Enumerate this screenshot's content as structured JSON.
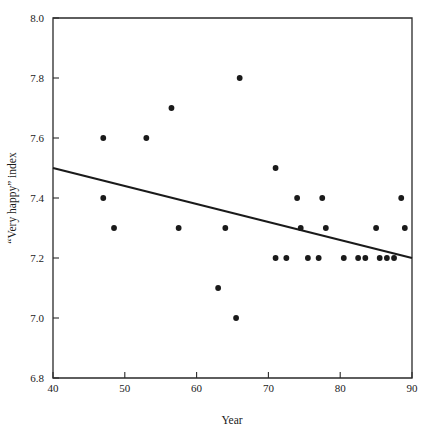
{
  "chart_data": {
    "type": "scatter",
    "title": "",
    "xlabel": "Year",
    "ylabel": "“Very happy” index",
    "xlim": [
      40,
      90
    ],
    "ylim": [
      6.8,
      8.0
    ],
    "xticks": [
      40,
      50,
      60,
      70,
      80,
      90
    ],
    "xtick_labels": [
      "40",
      "50",
      "60",
      "70",
      "80",
      "90"
    ],
    "yticks": [
      6.8,
      7.0,
      7.2,
      7.4,
      7.6,
      7.8,
      8.0
    ],
    "ytick_labels": [
      "6.8",
      "7.0",
      "7.2",
      "7.4",
      "7.6",
      "7.8",
      "8.0"
    ],
    "grid": false,
    "legend": null,
    "series": [
      {
        "name": "“Very happy” index by year",
        "marker": "filled-circle",
        "color": "#1a1a1a",
        "points": [
          {
            "x": 47,
            "y": 7.6
          },
          {
            "x": 47,
            "y": 7.4
          },
          {
            "x": 48.5,
            "y": 7.3
          },
          {
            "x": 53,
            "y": 7.6
          },
          {
            "x": 56.5,
            "y": 7.7
          },
          {
            "x": 57.5,
            "y": 7.3
          },
          {
            "x": 63,
            "y": 7.1
          },
          {
            "x": 64,
            "y": 7.3
          },
          {
            "x": 65.5,
            "y": 7.0
          },
          {
            "x": 66,
            "y": 7.8
          },
          {
            "x": 71,
            "y": 7.5
          },
          {
            "x": 71,
            "y": 7.2
          },
          {
            "x": 72.5,
            "y": 7.2
          },
          {
            "x": 74,
            "y": 7.4
          },
          {
            "x": 74.5,
            "y": 7.3
          },
          {
            "x": 75.5,
            "y": 7.2
          },
          {
            "x": 77,
            "y": 7.2
          },
          {
            "x": 77.5,
            "y": 7.4
          },
          {
            "x": 78,
            "y": 7.3
          },
          {
            "x": 80.5,
            "y": 7.2
          },
          {
            "x": 82.5,
            "y": 7.2
          },
          {
            "x": 83.5,
            "y": 7.2
          },
          {
            "x": 85,
            "y": 7.3
          },
          {
            "x": 85.5,
            "y": 7.2
          },
          {
            "x": 86.5,
            "y": 7.2
          },
          {
            "x": 87.5,
            "y": 7.2
          },
          {
            "x": 88.5,
            "y": 7.4
          },
          {
            "x": 89,
            "y": 7.3
          }
        ]
      }
    ],
    "trend_line": {
      "name": "linear fit",
      "color": "#1a1a1a",
      "x_start": 40,
      "y_start": 7.5,
      "x_end": 90,
      "y_end": 7.2
    }
  }
}
